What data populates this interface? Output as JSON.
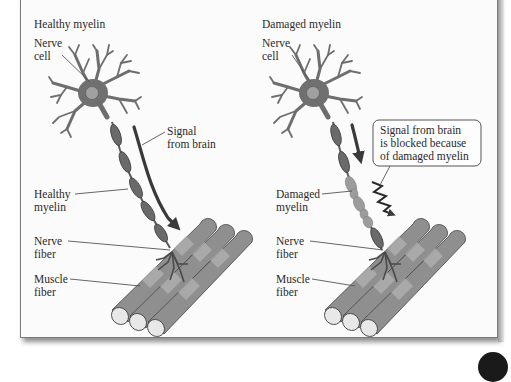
{
  "panels": [
    {
      "title": "Healthy myelin",
      "labels": {
        "nerve_cell": [
          "Nerve",
          "cell"
        ],
        "signal": [
          "Signal",
          "from brain"
        ],
        "myelin": [
          "Healthy",
          "myelin"
        ],
        "nerve_fiber": [
          "Nerve",
          "fiber"
        ],
        "muscle_fiber": [
          "Muscle",
          "fiber"
        ]
      }
    },
    {
      "title": "Damaged myelin",
      "labels": {
        "nerve_cell": [
          "Nerve",
          "cell"
        ],
        "signal_blocked": [
          "Signal from brain",
          "is blocked because",
          "of damaged myelin"
        ],
        "myelin": [
          "Damaged",
          "myelin"
        ],
        "nerve_fiber": [
          "Nerve",
          "fiber"
        ],
        "muscle_fiber": [
          "Muscle",
          "fiber"
        ]
      }
    }
  ],
  "colors": {
    "frame_border": "#7a7a7a",
    "background": "#fbfbfb",
    "neuron": "#6e6e6e",
    "myelin": "#6a6a6a",
    "muscle": "#8f8f8f"
  }
}
